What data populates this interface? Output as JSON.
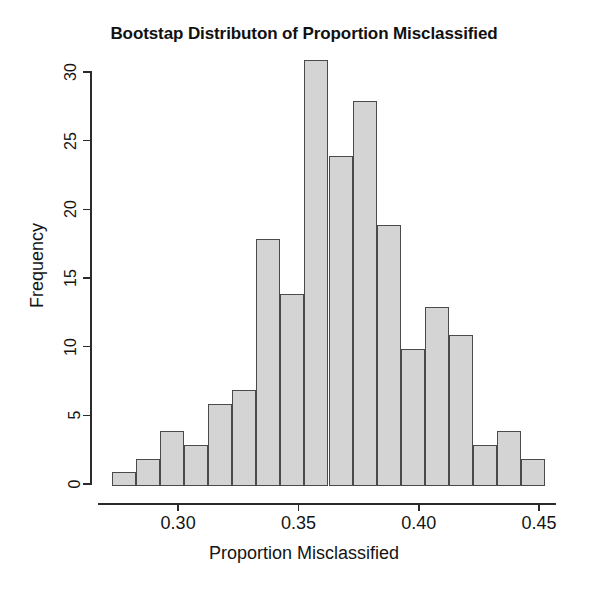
{
  "chart_data": {
    "type": "bar",
    "subtype": "histogram",
    "title": "Bootstap Distributon of Proportion Misclassified",
    "xlabel": "Proportion Misclassified",
    "ylabel": "Frequency",
    "grid": false,
    "legend": null,
    "xlim": [
      0.27,
      0.455
    ],
    "ylim": [
      0,
      31.5
    ],
    "bin_width": 0.01,
    "bin_edges": [
      0.2725,
      0.2825,
      0.2925,
      0.3025,
      0.3125,
      0.3225,
      0.3325,
      0.3425,
      0.3525,
      0.3625,
      0.3725,
      0.3825,
      0.3925,
      0.4025,
      0.4125,
      0.4225,
      0.4325,
      0.4425,
      0.4525
    ],
    "categories": [
      "0.2725-0.2825",
      "0.2825-0.2925",
      "0.2925-0.3025",
      "0.3025-0.3125",
      "0.3125-0.3225",
      "0.3225-0.3325",
      "0.3325-0.3425",
      "0.3425-0.3525",
      "0.3525-0.3625",
      "0.3625-0.3725",
      "0.3725-0.3825",
      "0.3825-0.3925",
      "0.3925-0.4025",
      "0.4025-0.4125",
      "0.4125-0.4225",
      "0.4225-0.4325",
      "0.4325-0.4425",
      "0.4425-0.4525"
    ],
    "values": [
      1,
      2,
      4,
      3,
      6,
      7,
      18,
      14,
      31,
      24,
      28,
      19,
      10,
      13,
      11,
      3,
      4,
      2
    ],
    "x_ticks": [
      0.3,
      0.35,
      0.4,
      0.45
    ],
    "x_tick_labels": [
      "0.30",
      "0.35",
      "0.40",
      "0.45"
    ],
    "y_ticks": [
      0,
      5,
      10,
      15,
      20,
      25,
      30
    ],
    "y_tick_labels": [
      "0",
      "5",
      "10",
      "15",
      "20",
      "25",
      "30"
    ],
    "bar_fill_color": "#d4d4d4",
    "bar_border_color": "#4a4a4a",
    "axis_color": "#2b2b2b",
    "background_color": "#ffffff"
  }
}
